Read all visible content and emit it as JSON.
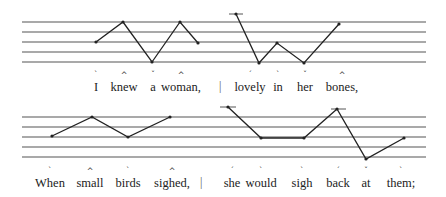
{
  "staff_color": "#555555",
  "contour_color": "#222222",
  "lines": [
    {
      "staff_top": 22,
      "staff_spacing": 10,
      "staff_x": [
        22,
        426
      ],
      "text_y": 80,
      "mark_y": 72,
      "words": [
        {
          "text": "I",
          "x": 96,
          "mark": "`"
        },
        {
          "text": "knew",
          "x": 124,
          "mark": "^"
        },
        {
          "text": "a",
          "x": 153,
          "mark": "ˇ"
        },
        {
          "text": "woman,",
          "x": 181,
          "mark": "^"
        },
        {
          "text": "lovely",
          "x": 250,
          "mark": "´"
        },
        {
          "text": "in",
          "x": 278,
          "mark": "`"
        },
        {
          "text": "her",
          "x": 305,
          "mark": "ˇ"
        },
        {
          "text": "bones,",
          "x": 342,
          "mark": "^"
        }
      ],
      "separator_x": 219,
      "contours": [
        [
          [
            96,
            42
          ],
          [
            123,
            22
          ],
          [
            152,
            62
          ],
          [
            180,
            22
          ],
          [
            198,
            43
          ]
        ],
        [
          [
            236,
            14
          ],
          [
            259,
            63
          ],
          [
            277,
            43
          ],
          [
            304,
            63
          ],
          [
            339,
            24
          ]
        ]
      ],
      "ledgers": [
        [
          229,
          243,
          14
        ]
      ]
    },
    {
      "staff_top": 117,
      "staff_spacing": 10,
      "staff_x": [
        22,
        426
      ],
      "text_y": 176,
      "mark_y": 168,
      "words": [
        {
          "text": "When",
          "x": 50,
          "mark": "`"
        },
        {
          "text": "small",
          "x": 90,
          "mark": "^"
        },
        {
          "text": "birds",
          "x": 128,
          "mark": "`"
        },
        {
          "text": "sighed,",
          "x": 172,
          "mark": "^"
        },
        {
          "text": "she",
          "x": 232,
          "mark": "´"
        },
        {
          "text": "would",
          "x": 261,
          "mark": "`"
        },
        {
          "text": "sigh",
          "x": 302,
          "mark": "`"
        },
        {
          "text": "back",
          "x": 338,
          "mark": "´"
        },
        {
          "text": "at",
          "x": 366,
          "mark": "ˇ"
        },
        {
          "text": "them;",
          "x": 401,
          "mark": "`"
        }
      ],
      "separator_x": 200,
      "contours": [
        [
          [
            52,
            136
          ],
          [
            92,
            117
          ],
          [
            128,
            137
          ],
          [
            170,
            117
          ]
        ],
        [
          [
            228,
            107
          ],
          [
            261,
            138
          ],
          [
            304,
            138
          ],
          [
            337,
            109
          ],
          [
            366,
            159
          ],
          [
            404,
            138
          ]
        ]
      ],
      "ledgers": [
        [
          220,
          236,
          107
        ],
        [
          331,
          346,
          109
        ]
      ]
    }
  ]
}
